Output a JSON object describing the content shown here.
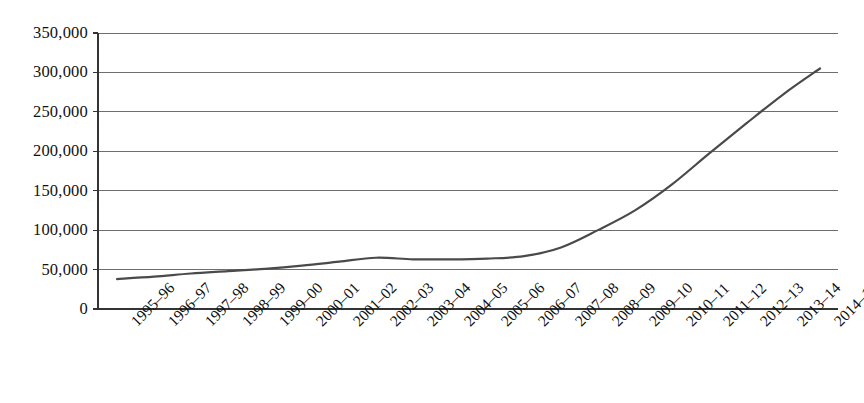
{
  "chart_data": {
    "type": "line",
    "title": "",
    "subtitle": "",
    "xlabel": "",
    "ylabel": "",
    "grid": true,
    "legend": false,
    "legend_position": "none",
    "line_color": "#4a4a4a",
    "axis_color": "#333333",
    "grid_color": "#6e6e6e",
    "background": "#ffffff",
    "ylim": [
      0,
      350000
    ],
    "ytick_values": [
      0,
      50000,
      100000,
      150000,
      200000,
      250000,
      300000,
      350000
    ],
    "ytick_labels": [
      "0",
      "50,000",
      "100,000",
      "150,000",
      "200,000",
      "250,000",
      "300,000",
      "350,000"
    ],
    "categories": [
      "1995–96",
      "1996–97",
      "1997–98",
      "1998–99",
      "1999–00",
      "2000–01",
      "2001–02",
      "2002–03",
      "2003–04",
      "2004–05",
      "2005–06",
      "2006–07",
      "2007–08",
      "2008–09",
      "2009–10",
      "2010–11",
      "2011–12",
      "2012–13",
      "2013–14",
      "2014–15"
    ],
    "values": [
      38000,
      41000,
      45000,
      48000,
      51000,
      55000,
      60000,
      65000,
      63000,
      63000,
      64000,
      67000,
      78000,
      100000,
      125000,
      158000,
      197000,
      235000,
      272000,
      305000
    ]
  }
}
